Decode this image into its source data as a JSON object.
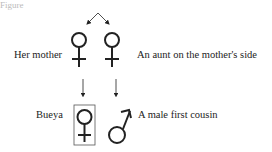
{
  "diagram": {
    "top_cut_text": "Figure",
    "labels": {
      "mother": "Her mother",
      "aunt": "An aunt on the mother's side",
      "ego": "Bueya",
      "cousin": "A male first cousin"
    },
    "symbols": {
      "mother": "female-symbol",
      "aunt": "female-symbol",
      "ego": "female-symbol-boxed",
      "cousin": "male-symbol"
    },
    "colors": {
      "line": "#222222",
      "box": "#555555"
    }
  }
}
